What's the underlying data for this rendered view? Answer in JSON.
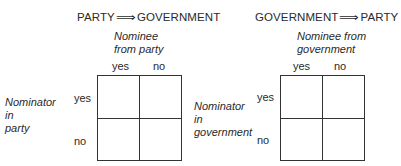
{
  "left_panel": {
    "title_from": "PARTY",
    "title_arrow": "⟹",
    "title_to": "GOVERNMENT",
    "column_header": "Nominee\nfrom party",
    "column_yes": "yes",
    "column_no": "no",
    "row_header": "Nominator\nin\nparty",
    "row_yes": "yes",
    "row_no": "no"
  },
  "right_panel": {
    "title_from": "GOVERNMENT",
    "title_arrow": "⟹",
    "title_to": "PARTY",
    "column_header": "Nominee from\ngovernment",
    "column_yes": "yes",
    "column_no": "no",
    "row_header": "Nominator\nin\ngovernment",
    "row_yes": "yes",
    "row_no": "no"
  },
  "colors": {
    "line": "#333333",
    "text": "#2a2a2a",
    "background": "#ffffff"
  }
}
